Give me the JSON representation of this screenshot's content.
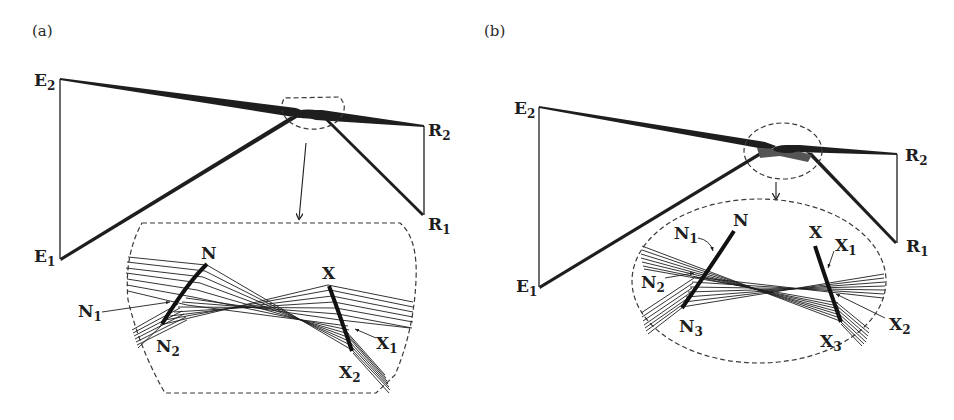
{
  "figure": {
    "panels": [
      {
        "id": "a",
        "tag": "(a)",
        "labels": {
          "E2": {
            "main": "E",
            "sub": "2"
          },
          "E1": {
            "main": "E",
            "sub": "1"
          },
          "R2": {
            "main": "R",
            "sub": "2"
          },
          "R1": {
            "main": "R",
            "sub": "1"
          },
          "N": {
            "main": "N",
            "sub": ""
          },
          "N1": {
            "main": "N",
            "sub": "1"
          },
          "N2": {
            "main": "N",
            "sub": "2"
          },
          "X": {
            "main": "X",
            "sub": ""
          },
          "X1": {
            "main": "X",
            "sub": "1"
          },
          "X2": {
            "main": "X",
            "sub": "2"
          }
        },
        "inset_shape": "rounded-barrel",
        "focus_marker_shape": "half-ellipse"
      },
      {
        "id": "b",
        "tag": "(b)",
        "labels": {
          "E2": {
            "main": "E",
            "sub": "2"
          },
          "E1": {
            "main": "E",
            "sub": "1"
          },
          "R2": {
            "main": "R",
            "sub": "2"
          },
          "R1": {
            "main": "R",
            "sub": "1"
          },
          "N": {
            "main": "N",
            "sub": ""
          },
          "N1": {
            "main": "N",
            "sub": "1"
          },
          "N2": {
            "main": "N",
            "sub": "2"
          },
          "N3": {
            "main": "N",
            "sub": "3"
          },
          "X": {
            "main": "X",
            "sub": ""
          },
          "X1": {
            "main": "X",
            "sub": "1"
          },
          "X2": {
            "main": "X",
            "sub": "2"
          },
          "X3": {
            "main": "X",
            "sub": "3"
          }
        },
        "inset_shape": "ellipse",
        "focus_marker_shape": "ellipse"
      }
    ],
    "colors": {
      "ink": "#1e1e1e",
      "dash": "#3a3a3a",
      "background": "#ffffff"
    }
  }
}
